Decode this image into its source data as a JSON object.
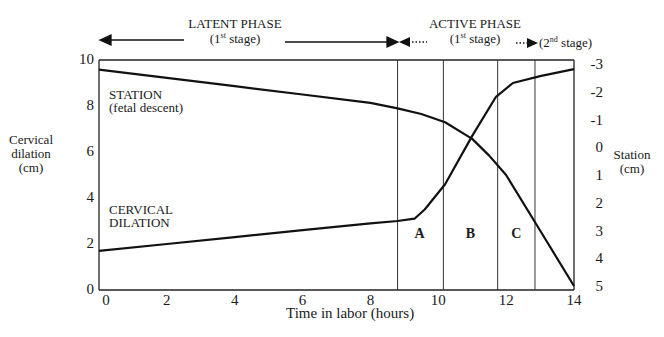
{
  "chart_data": {
    "type": "line",
    "title": "",
    "xlabel": "Time in labor (hours)",
    "ylabel_left": "Cervical dilation (cm)",
    "ylabel_right": "Station (cm)",
    "xlim": [
      0,
      14
    ],
    "ylim_left": [
      0,
      10
    ],
    "ylim_right": [
      -3,
      5
    ],
    "right_axis_inverted": true,
    "grid": false,
    "legend": "inline labels",
    "x_ticks": [
      "0",
      "2",
      "4",
      "6",
      "8",
      "10",
      "12",
      "14"
    ],
    "y_ticks_left": [
      "0",
      "2",
      "4",
      "6",
      "8",
      "10"
    ],
    "y_ticks_right": [
      "-3",
      "-2",
      "-1",
      "0",
      "1",
      "2",
      "3",
      "4",
      "5"
    ],
    "series": [
      {
        "name": "CERVICAL DILATION",
        "axis": "left",
        "x": [
          0,
          2,
          4,
          6,
          8,
          8.8,
          9.3,
          9.6,
          10.2,
          11.0,
          11.7,
          12.2,
          13.0,
          14.2
        ],
        "values": [
          1.7,
          2.0,
          2.3,
          2.6,
          2.9,
          3.0,
          3.1,
          3.5,
          4.6,
          6.7,
          8.4,
          9.0,
          9.3,
          9.6
        ]
      },
      {
        "name": "STATION (fetal descent)",
        "axis": "right",
        "x": [
          0,
          2,
          4,
          6,
          8,
          8.8,
          9.5,
          10.2,
          11.0,
          11.5,
          12.0,
          13.0,
          14.2
        ],
        "values": [
          -2.8,
          -2.5,
          -2.2,
          -1.9,
          -1.6,
          -1.4,
          -1.2,
          -0.9,
          -0.3,
          0.3,
          1.0,
          3.0,
          5.0
        ]
      }
    ],
    "vertical_markers_hours": [
      8.8,
      10.15,
      11.75,
      12.85
    ],
    "region_labels": [
      {
        "label": "A",
        "x_hours": 9.45
      },
      {
        "label": "B",
        "x_hours": 10.95
      },
      {
        "label": "C",
        "x_hours": 12.3
      }
    ],
    "annotations": {
      "latent_phase": {
        "title": "LATENT PHASE",
        "sub_base": "(1",
        "sub_sup": "st",
        "sub_tail": " stage)"
      },
      "active_phase": {
        "title": "ACTIVE PHASE",
        "sub_base": "(1",
        "sub_sup": "st",
        "sub_tail": " stage)"
      },
      "second_stage": {
        "sub_base": "(2",
        "sub_sup": "nd",
        "sub_tail": " stage)"
      }
    },
    "series_labels": {
      "station_line1": "STATION",
      "station_line2": "(fetal descent)",
      "dilation_line1": "CERVICAL",
      "dilation_line2": "DILATION"
    },
    "axis_labels": {
      "left_line1": "Cervical",
      "left_line2": "dilation",
      "left_line3": "(cm)",
      "right_line1": "Station",
      "right_line2": "(cm)"
    }
  },
  "colors": {
    "line": "#111111",
    "frame": "#222222",
    "background": "#ffffff"
  }
}
